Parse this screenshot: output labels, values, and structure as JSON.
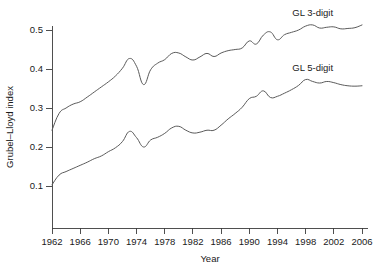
{
  "chart_data": {
    "type": "line",
    "title": "",
    "xlabel": "Year",
    "ylabel": "Grubel–Lloyd index",
    "xlim": [
      1962,
      2006
    ],
    "ylim": [
      0.0,
      0.55
    ],
    "grid": false,
    "legend_position": "inline-right",
    "xticks": [
      1962,
      1966,
      1970,
      1974,
      1978,
      1982,
      1986,
      1990,
      1994,
      1998,
      2002,
      2006
    ],
    "xtick_labels": [
      "1962",
      "1966",
      "1970",
      "1974",
      "1978",
      "1982",
      "1986",
      "1990",
      "1994",
      "1998",
      "2002",
      "2006"
    ],
    "yticks": [
      0.1,
      0.2,
      0.3,
      0.4,
      0.5
    ],
    "ytick_labels": [
      "0.1",
      "0.2",
      "0.3",
      "0.4",
      "0.5"
    ],
    "x": [
      1962,
      1963,
      1964,
      1965,
      1966,
      1967,
      1968,
      1969,
      1970,
      1971,
      1972,
      1973,
      1974,
      1975,
      1976,
      1977,
      1978,
      1979,
      1980,
      1981,
      1982,
      1983,
      1984,
      1985,
      1986,
      1987,
      1988,
      1989,
      1990,
      1991,
      1992,
      1993,
      1994,
      1995,
      1996,
      1997,
      1998,
      1999,
      2000,
      2001,
      2002,
      2003,
      2004,
      2005,
      2006
    ],
    "series": [
      {
        "name": "GL 3-digit",
        "color": "#5a5a5a",
        "label_x": 1999,
        "label_y": 0.535,
        "values": [
          0.243,
          0.286,
          0.3,
          0.31,
          0.316,
          0.328,
          0.341,
          0.354,
          0.367,
          0.382,
          0.402,
          0.427,
          0.407,
          0.36,
          0.398,
          0.415,
          0.424,
          0.44,
          0.441,
          0.431,
          0.423,
          0.431,
          0.44,
          0.432,
          0.441,
          0.447,
          0.45,
          0.454,
          0.472,
          0.464,
          0.487,
          0.495,
          0.475,
          0.488,
          0.494,
          0.5,
          0.51,
          0.513,
          0.505,
          0.507,
          0.508,
          0.503,
          0.504,
          0.506,
          0.513
        ]
      },
      {
        "name": "GL 5-digit",
        "color": "#5a5a5a",
        "label_x": 1999,
        "label_y": 0.395,
        "values": [
          0.103,
          0.128,
          0.137,
          0.145,
          0.153,
          0.161,
          0.17,
          0.177,
          0.188,
          0.198,
          0.214,
          0.24,
          0.224,
          0.2,
          0.218,
          0.225,
          0.235,
          0.249,
          0.253,
          0.243,
          0.236,
          0.238,
          0.243,
          0.243,
          0.256,
          0.272,
          0.286,
          0.302,
          0.324,
          0.33,
          0.344,
          0.327,
          0.33,
          0.338,
          0.347,
          0.358,
          0.373,
          0.368,
          0.364,
          0.368,
          0.365,
          0.36,
          0.357,
          0.356,
          0.357
        ]
      }
    ]
  }
}
